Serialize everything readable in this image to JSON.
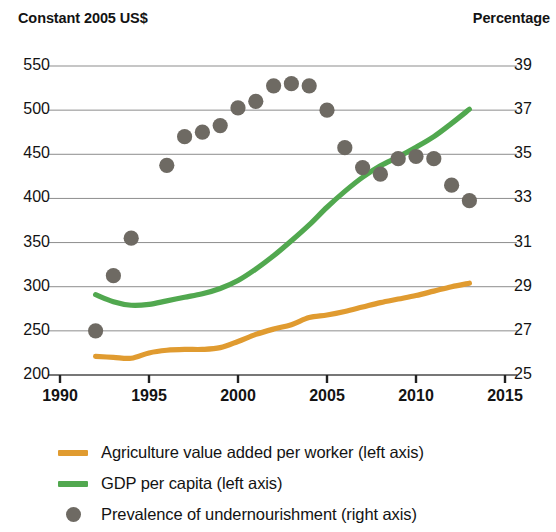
{
  "axis_captions": {
    "left": "Constant 2005 US$",
    "right": "Percentage"
  },
  "legend": {
    "items": [
      {
        "label": "Agriculture value added per worker (left axis)",
        "marker": "line-swatch",
        "color": "#E09B30",
        "name": "legend-item-agriculture"
      },
      {
        "label": "GDP per capita (left axis)",
        "marker": "line-swatch",
        "color": "#51A84F",
        "name": "legend-item-gdp"
      },
      {
        "label": "Prevalence of undernourishment (right axis)",
        "marker": "dot-swatch",
        "color": "#6E6A63",
        "name": "legend-item-undernourishment"
      }
    ]
  },
  "chart_data": {
    "type": "line",
    "title": "",
    "subtitle": "",
    "xlabel": "",
    "ylabel": "Constant 2005 US$",
    "y2label": "Percentage",
    "xlim": [
      1990,
      2015
    ],
    "ylim": [
      200,
      550
    ],
    "y2lim": [
      25,
      39
    ],
    "xticks": [
      1990,
      1995,
      2000,
      2005,
      2010,
      2015
    ],
    "yticks": [
      200,
      250,
      300,
      350,
      400,
      450,
      500,
      550
    ],
    "y2ticks": [
      25,
      27,
      29,
      31,
      33,
      35,
      37,
      39
    ],
    "grid": true,
    "legend_position": "bottom",
    "series": [
      {
        "name": "Agriculture value added per worker (left axis)",
        "type": "line",
        "axis": "left",
        "color": "#E09B30",
        "x": [
          1992,
          1993,
          1994,
          1995,
          1996,
          1997,
          1998,
          1999,
          2000,
          2001,
          2002,
          2003,
          2004,
          2005,
          2006,
          2007,
          2008,
          2009,
          2010,
          2011,
          2012,
          2013
        ],
        "values": [
          221,
          220,
          219,
          225,
          228,
          229,
          229,
          231,
          238,
          246,
          252,
          257,
          265,
          268,
          272,
          277,
          282,
          286,
          290,
          295,
          300,
          304
        ]
      },
      {
        "name": "GDP per capita (left axis)",
        "type": "line",
        "axis": "left",
        "color": "#51A84F",
        "x": [
          1992,
          1993,
          1994,
          1995,
          1996,
          1997,
          1998,
          1999,
          2000,
          2001,
          2002,
          2003,
          2004,
          2005,
          2006,
          2007,
          2008,
          2009,
          2010,
          2011,
          2012,
          2013
        ],
        "values": [
          291,
          283,
          279,
          280,
          284,
          288,
          292,
          298,
          307,
          320,
          335,
          352,
          370,
          390,
          408,
          424,
          437,
          447,
          458,
          470,
          485,
          501
        ]
      },
      {
        "name": "Prevalence of undernourishment (right axis)",
        "type": "scatter",
        "axis": "right",
        "color": "#6E6A63",
        "x": [
          1992,
          1993,
          1994,
          1996,
          1997,
          1998,
          1999,
          2000,
          2001,
          2002,
          2003,
          2004,
          2005,
          2006,
          2007,
          2008,
          2009,
          2010,
          2011,
          2012,
          2013
        ],
        "values": [
          27.0,
          29.5,
          31.2,
          34.5,
          35.8,
          36.0,
          36.3,
          37.1,
          37.4,
          38.1,
          38.2,
          38.1,
          37.0,
          35.3,
          34.4,
          34.1,
          34.8,
          34.9,
          34.8,
          33.6,
          32.9
        ]
      }
    ]
  }
}
